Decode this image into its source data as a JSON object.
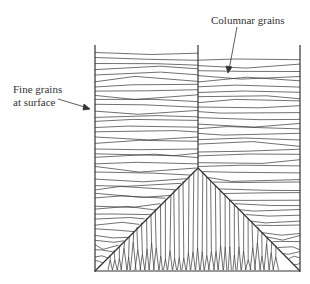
{
  "diagram": {
    "labels": {
      "columnar": "Columnar grains",
      "fine_line1": "Fine grains",
      "fine_line2": "at surface"
    },
    "colors": {
      "line": "#333333",
      "background": "#ffffff"
    },
    "mold": {
      "left": 95,
      "right": 300,
      "top": 45,
      "bottom": 270,
      "center": 198,
      "apex_y": 168
    }
  }
}
